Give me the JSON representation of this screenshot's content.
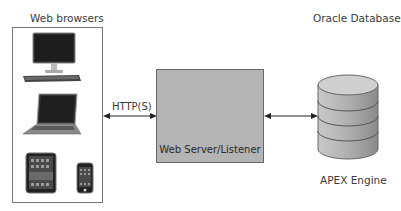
{
  "diagram": {
    "browsers_group": {
      "title": "Web browsers",
      "devices": [
        {
          "name": "desktop-computer",
          "label": "Desktop computer"
        },
        {
          "name": "laptop",
          "label": "Laptop"
        },
        {
          "name": "tablet",
          "label": "Tablet"
        },
        {
          "name": "smartphone",
          "label": "Smartphone"
        }
      ]
    },
    "connection_browsers_server": {
      "label": "HTTP(S)",
      "direction": "bidirectional"
    },
    "server": {
      "label": "Web Server/Listener",
      "fill_color": "#b4b4b4"
    },
    "connection_server_database": {
      "label": "",
      "direction": "bidirectional"
    },
    "database": {
      "title": "Oracle Database",
      "label": "APEX Engine"
    }
  }
}
